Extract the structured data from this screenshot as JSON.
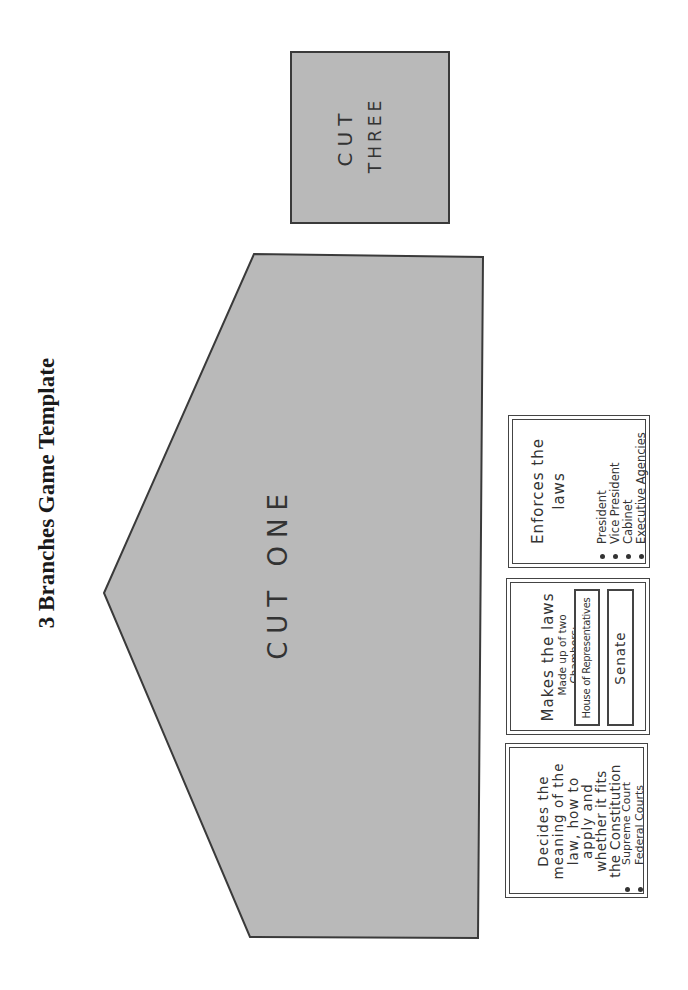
{
  "document": {
    "title": "3 Branches Game Template"
  },
  "cutouts": {
    "cut_one": {
      "label": "CUT ONE",
      "fill": "#b9b9b9",
      "stroke": "#3a3a3a"
    },
    "cut_three": {
      "label_line1": "CUT",
      "label_line2": "THREE",
      "fill": "#b9b9b9",
      "stroke": "#3a3a3a"
    }
  },
  "cards": {
    "executive": {
      "heading_line1": "Enforces the",
      "heading_line2": "laws",
      "items": [
        "President",
        "Vice President",
        "Cabinet",
        "Executive Agencies"
      ]
    },
    "legislative": {
      "heading": "Makes the laws",
      "subheading_line1": "Made up of two",
      "subheading_line2": "Chambers:",
      "chambers": [
        "House of Representatives",
        "Senate"
      ]
    },
    "judicial": {
      "lines": [
        "Decides the",
        "meaning of the",
        "law, how to",
        "apply and",
        "whether it fits",
        "the Constitution"
      ],
      "items": [
        "Supreme Court",
        "Federal Courts"
      ]
    }
  }
}
